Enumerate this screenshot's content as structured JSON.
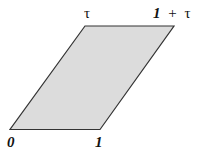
{
  "diagram": {
    "type": "parallelogram-lattice-cell",
    "fill_color": "#dcdcdc",
    "stroke_color": "#333333",
    "vertices": {
      "origin": {
        "label": "0"
      },
      "one": {
        "label": "1"
      },
      "tau": {
        "label": "τ"
      },
      "one_plus_tau": {
        "label_one": "1",
        "label_plus": "+",
        "label_tau": "τ"
      }
    }
  }
}
